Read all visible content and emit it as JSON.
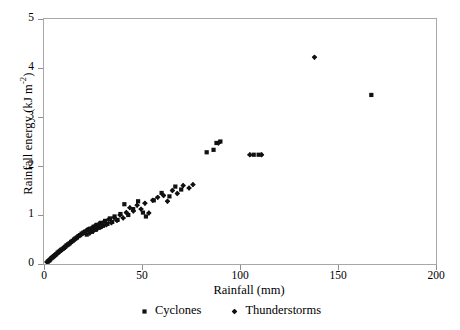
{
  "chart_data": {
    "type": "scatter",
    "title": "",
    "xlabel": "Rainfall (mm)",
    "ylabel_text": "Rainfall energy (kJ m",
    "ylabel_sup": "-2",
    "ylabel_tail": ")",
    "xlim": [
      0,
      200
    ],
    "ylim": [
      0,
      5
    ],
    "xticks": [
      0,
      50,
      100,
      150,
      200
    ],
    "yticks": [
      0,
      1,
      2,
      3,
      4,
      5
    ],
    "grid": false,
    "legend_position": "below-axes",
    "series": [
      {
        "name": "Cyclones",
        "marker": "square",
        "color": "#111111",
        "points": [
          [
            2.0,
            0.05
          ],
          [
            2.6,
            0.07
          ],
          [
            3.1,
            0.09
          ],
          [
            3.8,
            0.12
          ],
          [
            4.4,
            0.14
          ],
          [
            5.0,
            0.16
          ],
          [
            5.6,
            0.18
          ],
          [
            6.2,
            0.2
          ],
          [
            6.9,
            0.23
          ],
          [
            7.5,
            0.25
          ],
          [
            8.2,
            0.27
          ],
          [
            8.8,
            0.29
          ],
          [
            9.5,
            0.31
          ],
          [
            10.2,
            0.33
          ],
          [
            10.8,
            0.35
          ],
          [
            11.5,
            0.38
          ],
          [
            12.3,
            0.4
          ],
          [
            13.0,
            0.42
          ],
          [
            13.8,
            0.45
          ],
          [
            14.5,
            0.47
          ],
          [
            15.3,
            0.5
          ],
          [
            16.0,
            0.52
          ],
          [
            16.8,
            0.54
          ],
          [
            17.6,
            0.57
          ],
          [
            18.4,
            0.59
          ],
          [
            19.2,
            0.62
          ],
          [
            20.1,
            0.64
          ],
          [
            21.0,
            0.66
          ],
          [
            21.8,
            0.6
          ],
          [
            22.6,
            0.7
          ],
          [
            23.5,
            0.72
          ],
          [
            24.4,
            0.66
          ],
          [
            25.3,
            0.76
          ],
          [
            26.2,
            0.7
          ],
          [
            27.1,
            0.8
          ],
          [
            28.0,
            0.74
          ],
          [
            29.0,
            0.84
          ],
          [
            30.1,
            0.78
          ],
          [
            31.2,
            0.88
          ],
          [
            32.4,
            0.82
          ],
          [
            33.6,
            0.93
          ],
          [
            34.8,
            0.86
          ],
          [
            36.0,
            0.97
          ],
          [
            37.5,
            0.9
          ],
          [
            39.0,
            1.02
          ],
          [
            41.0,
            1.22
          ],
          [
            43.0,
            1.0
          ],
          [
            45.5,
            1.12
          ],
          [
            48.0,
            1.28
          ],
          [
            50.5,
            1.05
          ],
          [
            52.0,
            0.97
          ],
          [
            56.0,
            1.3
          ],
          [
            60.0,
            1.45
          ],
          [
            64.0,
            1.38
          ],
          [
            67.0,
            1.58
          ],
          [
            70.0,
            1.52
          ],
          [
            83.0,
            2.28
          ],
          [
            86.5,
            2.33
          ],
          [
            88.0,
            2.47
          ],
          [
            90.0,
            2.5
          ],
          [
            107.0,
            2.23
          ],
          [
            109.5,
            2.23
          ],
          [
            167.0,
            3.45
          ]
        ]
      },
      {
        "name": "Thunderstorms",
        "marker": "diamond",
        "color": "#111111",
        "points": [
          [
            1.5,
            0.04
          ],
          [
            2.2,
            0.06
          ],
          [
            2.9,
            0.08
          ],
          [
            3.5,
            0.1
          ],
          [
            4.1,
            0.13
          ],
          [
            4.8,
            0.15
          ],
          [
            5.4,
            0.17
          ],
          [
            6.0,
            0.19
          ],
          [
            6.7,
            0.21
          ],
          [
            7.3,
            0.24
          ],
          [
            8.0,
            0.26
          ],
          [
            8.6,
            0.28
          ],
          [
            9.3,
            0.3
          ],
          [
            10.0,
            0.32
          ],
          [
            10.6,
            0.34
          ],
          [
            11.3,
            0.37
          ],
          [
            12.0,
            0.39
          ],
          [
            12.8,
            0.41
          ],
          [
            13.5,
            0.44
          ],
          [
            14.2,
            0.46
          ],
          [
            15.0,
            0.48
          ],
          [
            15.8,
            0.51
          ],
          [
            16.5,
            0.53
          ],
          [
            17.3,
            0.56
          ],
          [
            18.1,
            0.58
          ],
          [
            19.0,
            0.6
          ],
          [
            19.8,
            0.63
          ],
          [
            20.6,
            0.65
          ],
          [
            21.5,
            0.68
          ],
          [
            22.4,
            0.7
          ],
          [
            23.3,
            0.63
          ],
          [
            24.2,
            0.73
          ],
          [
            25.1,
            0.67
          ],
          [
            26.0,
            0.78
          ],
          [
            27.0,
            0.71
          ],
          [
            28.2,
            0.82
          ],
          [
            29.4,
            0.76
          ],
          [
            30.6,
            0.86
          ],
          [
            31.8,
            0.8
          ],
          [
            33.0,
            0.91
          ],
          [
            34.4,
            0.84
          ],
          [
            35.8,
            0.95
          ],
          [
            37.2,
            0.89
          ],
          [
            38.8,
            1.0
          ],
          [
            40.4,
            0.94
          ],
          [
            42.0,
            1.05
          ],
          [
            43.8,
            1.15
          ],
          [
            45.6,
            1.08
          ],
          [
            47.5,
            1.2
          ],
          [
            49.5,
            1.12
          ],
          [
            51.5,
            1.24
          ],
          [
            53.5,
            1.04
          ],
          [
            55.5,
            1.3
          ],
          [
            58.0,
            1.36
          ],
          [
            61.0,
            1.4
          ],
          [
            63.0,
            1.28
          ],
          [
            65.5,
            1.5
          ],
          [
            68.0,
            1.44
          ],
          [
            71.0,
            1.6
          ],
          [
            74.0,
            1.55
          ],
          [
            76.0,
            1.62
          ],
          [
            89.0,
            2.47
          ],
          [
            105.0,
            2.23
          ],
          [
            111.0,
            2.23
          ],
          [
            138.0,
            4.22
          ]
        ]
      }
    ]
  }
}
